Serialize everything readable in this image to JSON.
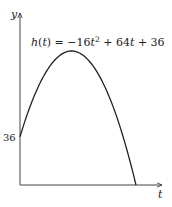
{
  "chart_data": {
    "type": "line",
    "title": "",
    "equation": {
      "prefix": "h",
      "open": "(",
      "var": "t",
      "close": ")",
      "eq": " = −16",
      "var2": "t",
      "exp": "2",
      "mid": " + 64",
      "var3": "t",
      "tail": " + 36"
    },
    "function": {
      "a": -16,
      "b": 64,
      "c": 36
    },
    "xlabel": "t",
    "ylabel": "y",
    "xlim": [
      0,
      4.5
    ],
    "ylim": [
      0,
      100
    ],
    "y_tick_labels": [
      {
        "value": 36,
        "label": "36"
      }
    ],
    "grid": false,
    "series": [
      {
        "name": "h(t)",
        "x_range": [
          0,
          4.5
        ],
        "color": "#222222"
      }
    ]
  }
}
